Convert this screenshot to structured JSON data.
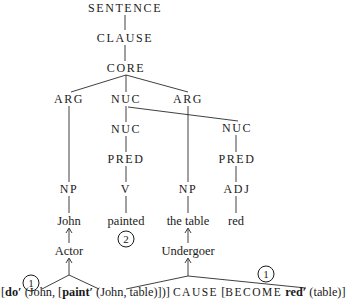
{
  "diagram": {
    "type": "RRG clause structure tree with linking",
    "tree": {
      "sentence": "SENTENCE",
      "clause": "CLAUSE",
      "core": "CORE",
      "core_children": [
        "ARG",
        "NUC",
        "ARG"
      ],
      "nuc_children": [
        "NUC",
        "NUC"
      ],
      "pred_left": "PRED",
      "pred_right": "PRED",
      "categories": [
        "NP",
        "V",
        "NP",
        "ADJ"
      ],
      "words": [
        "John",
        "painted",
        "the table",
        "red"
      ]
    },
    "macroroles": {
      "actor": "Actor",
      "undergoer": "Undergoer"
    },
    "step_markers": {
      "verb_step": "2",
      "left_step": "1",
      "right_step": "1"
    },
    "logical_structure": {
      "open1": "[",
      "do": "do′",
      "part1": " (John, [",
      "paint": "paint′",
      "part2": " (John, table)])] ",
      "cause": "CAUSE",
      "part3": " [",
      "become": "BECOME",
      "space": " ",
      "red": "red′",
      "part4": " (table)]"
    }
  }
}
